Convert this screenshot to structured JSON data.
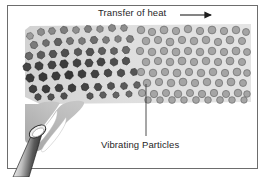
{
  "figure": {
    "kind": "science-diagram",
    "width": 266,
    "height": 177,
    "background_color": "#ffffff",
    "border_color": "#6d6d6d"
  },
  "labels": {
    "title": "Transfer of heat",
    "particles": "Vibrating Particles"
  },
  "annotations": {
    "heat_arrow": {
      "name": "heat-direction-arrow",
      "direction": "right",
      "x1": 180,
      "y1": 15,
      "x2": 216,
      "y2": 15,
      "color": "#1f1f1f"
    },
    "leader_line": {
      "name": "particles-leader-line",
      "x1": 146,
      "y1": 84,
      "x2": 146,
      "y2": 136,
      "color": "#3a3a3a"
    }
  },
  "solid_band": {
    "name": "solid-material-band",
    "x": 25,
    "y": 24,
    "width": 226,
    "height": 80,
    "fill": "#dcdcdc"
  },
  "particles": {
    "hot_color": "#4a4a4a",
    "hot_stroke": "#2c2c2c",
    "warm_color": "#8c8c8c",
    "warm_stroke": "#5a5a5a",
    "cool_color": "#a8a8a8",
    "cool_stroke": "#6b6b6b",
    "hot_count": 58,
    "cool_count": 96,
    "hot_shape": "hexagon",
    "cool_shape": "circle"
  },
  "flame": {
    "name": "bunsen-flame",
    "outer_fill": "#b4b4b4",
    "inner_fill": "#ffffff",
    "inner_stroke": "#9a9a9a"
  },
  "burner": {
    "name": "burner-tube",
    "body_light": "#f2f2f2",
    "body_dark": "#3c3c3c",
    "rim_fill": "#e8e8e8",
    "rim_stroke": "#2a2a2a"
  },
  "colors": {
    "text": "#1f1f1f",
    "line": "#3a3a3a",
    "frame": "#6d6d6d"
  }
}
